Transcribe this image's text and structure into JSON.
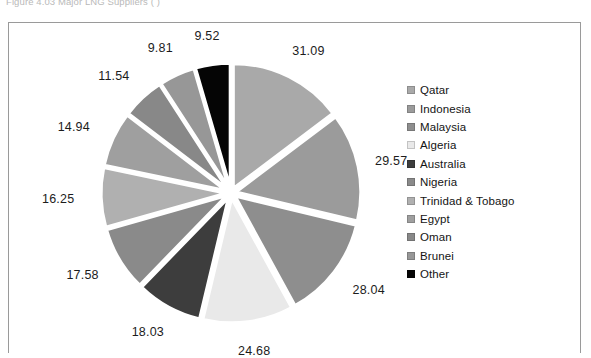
{
  "figure": {
    "caption": "Figure 4.03 Major LNG Suppliers (                      )"
  },
  "chart_data": {
    "type": "pie",
    "title": "",
    "subtitle": "",
    "xlabel": "",
    "ylabel": "",
    "grid": false,
    "legend_position": "right",
    "start_angle_deg": 0,
    "direction": "clockwise",
    "exploded": true,
    "total": 211.06,
    "categories": [
      "Qatar",
      "Indonesia",
      "Malaysia",
      "Algeria",
      "Australia",
      "Nigeria",
      "Trinidad & Tobago",
      "Egypt",
      "Oman",
      "Brunei",
      "Other"
    ],
    "values": [
      31.09,
      29.57,
      28.04,
      24.68,
      18.03,
      17.58,
      16.25,
      14.94,
      11.54,
      9.81,
      9.52
    ],
    "data_labels": [
      "31.09",
      "29.57",
      "28.04",
      "24.68",
      "18.03",
      "17.58",
      "16.25",
      "14.94",
      "11.54",
      "9.81",
      "9.52"
    ],
    "colors": [
      "#a9a9a9",
      "#9b9b9b",
      "#8e8e8e",
      "#e9e9e9",
      "#3d3d3d",
      "#8a8a8a",
      "#b0b0b0",
      "#9f9f9f",
      "#888888",
      "#979797",
      "#050505"
    ]
  },
  "legend": {
    "items": [
      {
        "label": "Qatar",
        "color": "#a9a9a9"
      },
      {
        "label": "Indonesia",
        "color": "#9b9b9b"
      },
      {
        "label": "Malaysia",
        "color": "#8e8e8e"
      },
      {
        "label": "Algeria",
        "color": "#e9e9e9"
      },
      {
        "label": "Australia",
        "color": "#3d3d3d"
      },
      {
        "label": "Nigeria",
        "color": "#8a8a8a"
      },
      {
        "label": "Trinidad & Tobago",
        "color": "#b0b0b0"
      },
      {
        "label": "Egypt",
        "color": "#9f9f9f"
      },
      {
        "label": "Oman",
        "color": "#888888"
      },
      {
        "label": "Brunei",
        "color": "#979797"
      },
      {
        "label": "Other",
        "color": "#050505"
      }
    ]
  }
}
